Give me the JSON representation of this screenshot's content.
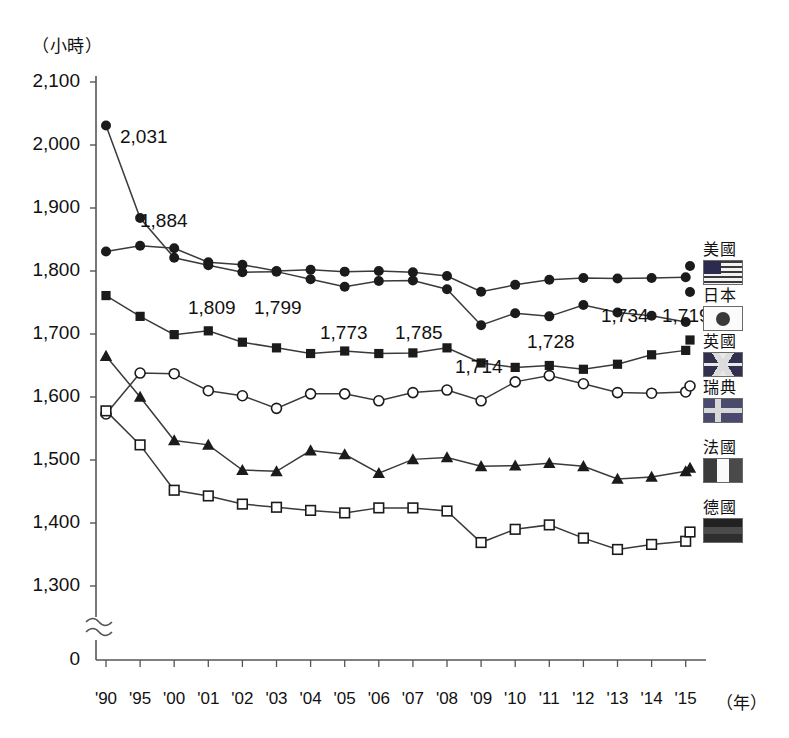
{
  "axis": {
    "unit_label": "（小時）",
    "x_unit_label": "（年）",
    "y_ticks": [
      "2,100",
      "2,000",
      "1,900",
      "1,800",
      "1,700",
      "1,600",
      "1,500",
      "1,400",
      "1,300",
      "0"
    ],
    "x_ticks": [
      "'90",
      "'95",
      "'00",
      "'01",
      "'02",
      "'03",
      "'04",
      "'05",
      "'06",
      "'07",
      "'08",
      "'09",
      "'10",
      "'11",
      "'12",
      "'13",
      "'14",
      "'15"
    ],
    "has_break": true
  },
  "legend": {
    "entries": [
      {
        "name": "美國",
        "flag": "us-flag-icon",
        "marker": "filled-circle"
      },
      {
        "name": "日本",
        "flag": "jp-flag-icon",
        "marker": "filled-circle"
      },
      {
        "name": "英國",
        "flag": "uk-flag-icon",
        "marker": "filled-square"
      },
      {
        "name": "瑞典",
        "flag": "se-flag-icon",
        "marker": "open-circle"
      },
      {
        "name": "法國",
        "flag": "fr-flag-icon",
        "marker": "filled-triangle"
      },
      {
        "name": "德國",
        "flag": "de-flag-icon",
        "marker": "open-square"
      }
    ]
  },
  "annotations": [
    {
      "text": "2,031",
      "x": 120,
      "y": 126
    },
    {
      "text": "1,884",
      "x": 140,
      "y": 210
    },
    {
      "text": "1,809",
      "x": 188,
      "y": 297
    },
    {
      "text": "1,799",
      "x": 254,
      "y": 297
    },
    {
      "text": "1,773",
      "x": 320,
      "y": 322
    },
    {
      "text": "1,785",
      "x": 395,
      "y": 322
    },
    {
      "text": "1,714",
      "x": 455,
      "y": 356
    },
    {
      "text": "1,728",
      "x": 527,
      "y": 331
    },
    {
      "text": "1,734",
      "x": 601,
      "y": 305
    },
    {
      "text": "1,719",
      "x": 662,
      "y": 305
    }
  ],
  "chart_data": {
    "type": "line",
    "title": "",
    "xlabel": "（年）",
    "ylabel": "（小時）",
    "ylim": [
      1300,
      2100
    ],
    "ytick_step": 100,
    "grid": false,
    "legend_position": "right",
    "axis_break": "between 0 and 1,300",
    "categories": [
      "'90",
      "'95",
      "'00",
      "'01",
      "'02",
      "'03",
      "'04",
      "'05",
      "'06",
      "'07",
      "'08",
      "'09",
      "'10",
      "'11",
      "'12",
      "'13",
      "'14",
      "'15"
    ],
    "series": [
      {
        "name": "美國",
        "marker": "filled-circle",
        "values": [
          1831,
          1840,
          1836,
          1814,
          1810,
          1800,
          1802,
          1799,
          1800,
          1798,
          1792,
          1767,
          1778,
          1786,
          1789,
          1788,
          1789,
          1790
        ]
      },
      {
        "name": "日本",
        "marker": "filled-circle",
        "values": [
          2031,
          1884,
          1821,
          1809,
          1798,
          1799,
          1787,
          1775,
          1784,
          1785,
          1771,
          1714,
          1733,
          1728,
          1746,
          1734,
          1729,
          1719
        ],
        "labeled_points": {
          "'90": "2,031",
          "'95": "1,884",
          "'01": "1,809",
          "'02": "1,799",
          "'05": "1,773",
          "'07": "1,785",
          "'09": "1,714",
          "'11": "1,728",
          "'13": "1,734",
          "'15": "1,719"
        }
      },
      {
        "name": "英國",
        "marker": "filled-square",
        "values": [
          1761,
          1728,
          1699,
          1705,
          1687,
          1678,
          1669,
          1673,
          1669,
          1670,
          1678,
          1654,
          1647,
          1650,
          1644,
          1652,
          1667,
          1674
        ]
      },
      {
        "name": "瑞典",
        "marker": "open-circle",
        "values": [
          1573,
          1638,
          1637,
          1610,
          1602,
          1582,
          1605,
          1605,
          1594,
          1607,
          1611,
          1594,
          1624,
          1634,
          1621,
          1607,
          1606,
          1608
        ]
      },
      {
        "name": "法國",
        "marker": "filled-triangle",
        "values": [
          1665,
          1600,
          1531,
          1524,
          1484,
          1482,
          1515,
          1509,
          1479,
          1501,
          1504,
          1490,
          1491,
          1495,
          1490,
          1470,
          1473,
          1482
        ]
      },
      {
        "name": "德國",
        "marker": "open-square",
        "values": [
          1578,
          1524,
          1452,
          1443,
          1430,
          1425,
          1420,
          1416,
          1424,
          1424,
          1419,
          1369,
          1390,
          1397,
          1376,
          1358,
          1366,
          1371
        ]
      }
    ]
  }
}
